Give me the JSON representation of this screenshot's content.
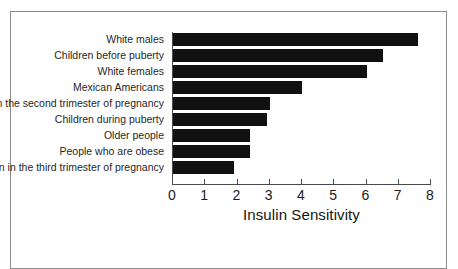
{
  "chart_data": {
    "type": "bar",
    "orientation": "horizontal",
    "title": "",
    "xlabel": "Insulin Sensitivity",
    "ylabel": "",
    "xlim": [
      0,
      8
    ],
    "xticks": [
      "0",
      "1",
      "2",
      "3",
      "4",
      "5",
      "6",
      "7",
      "8"
    ],
    "grid": false,
    "legend": null,
    "bar_color": "#111111",
    "categories": [
      "White males",
      "Children before puberty",
      "White females",
      "Mexican Americans",
      "Women in the second trimester of pregnancy",
      "Children during puberty",
      "Older people",
      "People who are obese",
      "Women in the third trimester of pregnancy"
    ],
    "values": [
      7.6,
      6.5,
      6.0,
      4.0,
      3.0,
      2.9,
      2.4,
      2.4,
      1.9
    ]
  }
}
